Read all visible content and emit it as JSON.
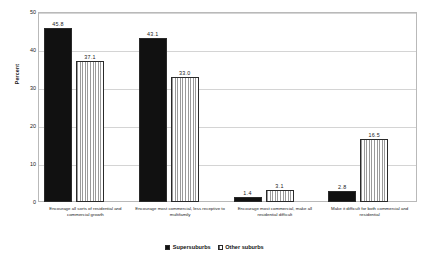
{
  "chart_data": {
    "type": "bar",
    "title": "",
    "xlabel": "",
    "ylabel": "Percent",
    "ylim": [
      0,
      50
    ],
    "yticks": [
      "0",
      "10",
      "20",
      "30",
      "40",
      "50"
    ],
    "grid": true,
    "legend_position": "bottom",
    "categories": [
      "Encourage all sorts of residential and commercial growth",
      "Encourage most commercial, less receptive to multifamily",
      "Encourage most commercial, make all residential difficult",
      "Make it difficult for both commercial and residential"
    ],
    "series": [
      {
        "name": "Supersuburbs",
        "color": "#111111",
        "pattern": "solid",
        "values": [
          45.8,
          43.1,
          1.4,
          2.8
        ],
        "labels": [
          "45.8",
          "43.1",
          "1.4",
          "2.8"
        ]
      },
      {
        "name": "Other suburbs",
        "color": "#e8e8e8",
        "pattern": "vertical-stripes",
        "values": [
          37.1,
          33.0,
          3.1,
          16.5
        ],
        "labels": [
          "37.1",
          "33.0",
          "3.1",
          "16.5"
        ]
      }
    ]
  }
}
